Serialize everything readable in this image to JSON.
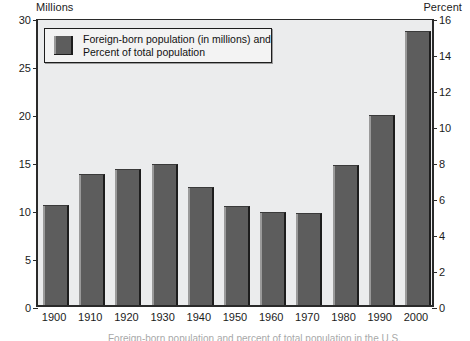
{
  "chart_data": {
    "type": "bar",
    "title": "",
    "xlabel": "",
    "categories": [
      "1900",
      "1910",
      "1920",
      "1930",
      "1940",
      "1950",
      "1960",
      "1970",
      "1980",
      "1990",
      "2000"
    ],
    "series": [
      {
        "name": "Foreign-born population (in millions) and Percent of total population",
        "values": [
          10.4,
          13.6,
          14.2,
          14.7,
          12.3,
          10.3,
          9.7,
          9.6,
          14.6,
          19.8,
          28.5
        ]
      }
    ],
    "left_axis": {
      "label": "Millions",
      "ylim": [
        0,
        30
      ],
      "ticks": [
        0,
        5,
        10,
        15,
        20,
        25,
        30
      ]
    },
    "right_axis": {
      "label": "Percent",
      "ylim": [
        0,
        16
      ],
      "ticks": [
        0,
        2,
        4,
        6,
        8,
        10,
        12,
        14,
        16
      ]
    },
    "grid": false,
    "legend_position": "top-left",
    "bar_color": "#5d5d5d",
    "plot_background": "#ebeced",
    "axis_color": "#2a2a2a"
  },
  "axes": {
    "left_caption": "Millions",
    "right_caption": "Percent"
  },
  "legend": {
    "line1": "Foreign-born population (in millions) and",
    "line2": "Percent of total population"
  },
  "caption": {
    "cropped_text": "Foreign-born population and percent of total population in the U.S."
  }
}
